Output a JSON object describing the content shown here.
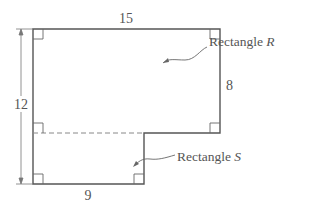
{
  "diagram": {
    "dimensions": {
      "top_width": "15",
      "total_height": "12",
      "right_height": "8",
      "bottom_width": "9"
    },
    "labels": {
      "rect_r_prefix": "Rectangle ",
      "rect_r_var": "R",
      "rect_s_prefix": "Rectangle ",
      "rect_s_var": "S"
    },
    "colors": {
      "stroke": "#555555",
      "dashed": "#888888",
      "text": "#555555"
    }
  }
}
